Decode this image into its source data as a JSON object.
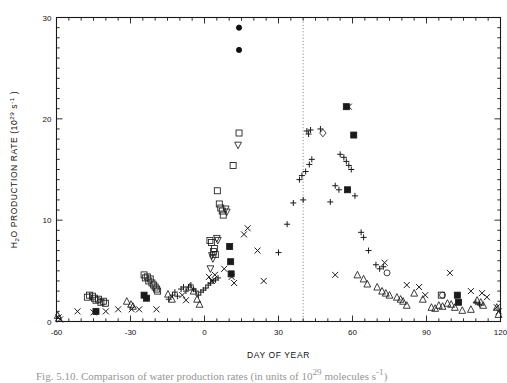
{
  "figure": {
    "caption_prefix": "Fig. 5.10.",
    "caption_text": "Comparison of water production rates (in units of 10",
    "caption_sup": "29",
    "caption_tail": " molecules s",
    "caption_sup2": "-1",
    "caption_end": ")"
  },
  "chart_data": {
    "type": "scatter",
    "title": "",
    "xlabel": "DAY OF YEAR",
    "ylabel": "H₂O PRODUCTION RATE (10²⁹ s⁻¹)",
    "ylabel_base": "H",
    "ylabel_sub": "2",
    "ylabel_mid": "O PRODUCTION RATE (10",
    "ylabel_exp": "29",
    "ylabel_mid2": " s",
    "ylabel_exp2": "-1",
    "ylabel_end": " )",
    "xlim": [
      -60,
      120
    ],
    "ylim": [
      0,
      30
    ],
    "xticks": [
      -60,
      -30,
      0,
      30,
      60,
      90,
      120
    ],
    "xticklabels": [
      "-60",
      "-30",
      "0",
      "30",
      "60",
      "90",
      "120"
    ],
    "yticks": [
      0,
      10,
      20,
      30
    ],
    "yticklabels": [
      "0",
      "10",
      "20",
      "30"
    ],
    "x_minor_step": 5,
    "y_minor_step": 1,
    "grid": false,
    "legend": "none",
    "annotations": [
      {
        "name": "perihelion-marker",
        "type": "vline",
        "x": 40,
        "style": "dotted"
      }
    ],
    "series": [
      {
        "name": "open-square",
        "marker": "square-open",
        "points": [
          [
            -47.5,
            2.4
          ],
          [
            -46.6,
            2.6
          ],
          [
            -45.4,
            2.5
          ],
          [
            -44.6,
            2.3
          ],
          [
            -44.0,
            2.1
          ],
          [
            -43.0,
            2.2
          ],
          [
            -42.0,
            1.9
          ],
          [
            -41.0,
            2.0
          ],
          [
            -40.2,
            1.8
          ],
          [
            -24.5,
            4.6
          ],
          [
            -24.0,
            4.3
          ],
          [
            -23.2,
            4.4
          ],
          [
            -22.6,
            4.0
          ],
          [
            -22.0,
            4.2
          ],
          [
            -21.3,
            3.8
          ],
          [
            -20.6,
            3.6
          ],
          [
            -20.0,
            3.4
          ],
          [
            -19.4,
            3.2
          ],
          [
            -19.0,
            3.0
          ],
          [
            4.0,
            7.2
          ],
          [
            3.6,
            6.9
          ],
          [
            4.4,
            6.6
          ],
          [
            2.2,
            8.0
          ],
          [
            2.8,
            7.8
          ],
          [
            6.0,
            11.6
          ],
          [
            6.6,
            11.2
          ],
          [
            7.2,
            10.9
          ],
          [
            7.6,
            10.5
          ],
          [
            5.2,
            12.9
          ],
          [
            11.6,
            15.4
          ],
          [
            14.0,
            18.6
          ],
          [
            96.0,
            2.6
          ]
        ]
      },
      {
        "name": "open-triangle-up",
        "marker": "triangle-up",
        "points": [
          [
            -59.5,
            0.6
          ],
          [
            -59.0,
            0.3
          ],
          [
            -31.5,
            2.0
          ],
          [
            -29.8,
            1.7
          ],
          [
            -29.0,
            1.5
          ],
          [
            -14.8,
            2.7
          ],
          [
            -13.2,
            2.2
          ],
          [
            -6.0,
            3.4
          ],
          [
            -4.4,
            3.0
          ],
          [
            -3.0,
            2.2
          ],
          [
            -2.0,
            1.7
          ],
          [
            62.0,
            4.6
          ],
          [
            64.5,
            4.2
          ],
          [
            66.0,
            3.7
          ],
          [
            70.0,
            3.4
          ],
          [
            72.0,
            3.0
          ],
          [
            73.5,
            2.8
          ],
          [
            75.0,
            2.6
          ],
          [
            78.0,
            2.4
          ],
          [
            79.5,
            2.2
          ],
          [
            80.5,
            2.0
          ],
          [
            82.0,
            1.6
          ],
          [
            85.0,
            2.8
          ],
          [
            88.5,
            2.2
          ],
          [
            92.0,
            1.4
          ],
          [
            93.5,
            1.3
          ],
          [
            95.0,
            1.6
          ],
          [
            96.5,
            1.5
          ],
          [
            98.5,
            1.8
          ],
          [
            100.0,
            1.7
          ],
          [
            101.5,
            1.4
          ],
          [
            104.5,
            1.1
          ],
          [
            108.0,
            1.2
          ],
          [
            110.5,
            2.1
          ],
          [
            112.0,
            1.9
          ],
          [
            113.0,
            1.6
          ],
          [
            118.5,
            1.4
          ],
          [
            119.2,
            0.7
          ]
        ]
      },
      {
        "name": "open-triangle-down",
        "marker": "triangle-down",
        "points": [
          [
            2.4,
            5.2
          ],
          [
            3.0,
            6.5
          ],
          [
            3.4,
            6.2
          ],
          [
            5.0,
            8.2
          ],
          [
            5.4,
            8.0
          ],
          [
            8.6,
            11.1
          ],
          [
            9.0,
            10.8
          ],
          [
            13.6,
            17.4
          ]
        ]
      },
      {
        "name": "cross",
        "marker": "x",
        "points": [
          [
            -59.2,
            0.4
          ],
          [
            -58.6,
            0.2
          ],
          [
            -51.5,
            1.0
          ],
          [
            -45.0,
            0.9
          ],
          [
            -40.0,
            1.0
          ],
          [
            -35.0,
            1.2
          ],
          [
            -29.5,
            1.2
          ],
          [
            -26.5,
            1.2
          ],
          [
            -19.5,
            1.2
          ],
          [
            -9.0,
            2.6
          ],
          [
            -7.5,
            2.1
          ],
          [
            1.8,
            4.4
          ],
          [
            3.0,
            4.0
          ],
          [
            4.2,
            4.6
          ],
          [
            8.0,
            5.2
          ],
          [
            11.0,
            4.4
          ],
          [
            17.5,
            9.2
          ],
          [
            16.0,
            8.6
          ],
          [
            21.5,
            7.0
          ],
          [
            12.0,
            3.8
          ],
          [
            24.0,
            4.0
          ],
          [
            53.0,
            4.6
          ],
          [
            58.5,
            21.2
          ],
          [
            73.0,
            5.8
          ],
          [
            82.0,
            3.6
          ],
          [
            87.0,
            3.4
          ],
          [
            89.5,
            2.6
          ],
          [
            99.5,
            4.8
          ],
          [
            108.0,
            3.0
          ],
          [
            112.5,
            2.8
          ],
          [
            114.5,
            2.4
          ],
          [
            118.5,
            1.4
          ],
          [
            119.3,
            1.0
          ]
        ]
      },
      {
        "name": "plus",
        "marker": "plus",
        "points": [
          [
            -14.5,
            2.2
          ],
          [
            -13.0,
            2.6
          ],
          [
            -12.0,
            2.9
          ],
          [
            -11.0,
            2.5
          ],
          [
            -9.5,
            3.2
          ],
          [
            -8.5,
            3.4
          ],
          [
            -7.5,
            3.0
          ],
          [
            -6.5,
            3.4
          ],
          [
            -5.5,
            3.6
          ],
          [
            -4.5,
            3.2
          ],
          [
            -3.5,
            3.0
          ],
          [
            -2.5,
            2.6
          ],
          [
            -1.5,
            2.9
          ],
          [
            -0.5,
            3.1
          ],
          [
            0.5,
            3.3
          ],
          [
            1.5,
            3.6
          ],
          [
            2.5,
            3.8
          ],
          [
            3.5,
            4.0
          ],
          [
            4.5,
            4.1
          ],
          [
            5.5,
            4.3
          ],
          [
            30.0,
            6.8
          ],
          [
            33.5,
            9.6
          ],
          [
            36.0,
            11.7
          ],
          [
            40.0,
            12.0
          ],
          [
            38.5,
            14.0
          ],
          [
            39.5,
            14.4
          ],
          [
            41.0,
            14.8
          ],
          [
            42.5,
            15.5
          ],
          [
            43.5,
            16.0
          ],
          [
            41.5,
            18.8
          ],
          [
            42.2,
            18.5
          ],
          [
            43.0,
            18.9
          ],
          [
            47.0,
            19.0
          ],
          [
            51.0,
            11.8
          ],
          [
            55.0,
            16.5
          ],
          [
            56.5,
            16.2
          ],
          [
            57.5,
            15.8
          ],
          [
            58.5,
            15.4
          ],
          [
            59.5,
            15.0
          ],
          [
            53.0,
            13.4
          ],
          [
            54.5,
            13.0
          ],
          [
            61.0,
            12.4
          ],
          [
            63.5,
            8.8
          ],
          [
            64.5,
            8.3
          ],
          [
            66.5,
            7.0
          ],
          [
            69.5,
            5.6
          ],
          [
            71.0,
            5.2
          ],
          [
            72.5,
            5.4
          ],
          [
            110.0,
            1.9
          ],
          [
            111.5,
            1.7
          ]
        ]
      },
      {
        "name": "filled-circle",
        "marker": "circle-filled",
        "points": [
          [
            14.0,
            29.0
          ],
          [
            14.0,
            26.8
          ]
        ]
      },
      {
        "name": "open-circle",
        "marker": "circle-open",
        "points": [
          [
            74.0,
            4.8
          ],
          [
            96.5,
            2.6
          ]
        ]
      },
      {
        "name": "open-diamond",
        "marker": "diamond-open",
        "points": [
          [
            48.0,
            18.6
          ]
        ]
      },
      {
        "name": "filled-square",
        "marker": "square-filled",
        "points": [
          [
            -44.0,
            1.0
          ],
          [
            -24.5,
            2.6
          ],
          [
            -23.5,
            2.3
          ],
          [
            10.2,
            7.4
          ],
          [
            10.6,
            5.9
          ],
          [
            10.8,
            4.7
          ],
          [
            57.5,
            21.2
          ],
          [
            60.5,
            18.4
          ],
          [
            58.0,
            13.0
          ],
          [
            102.5,
            2.6
          ],
          [
            103.0,
            1.9
          ]
        ]
      }
    ]
  }
}
